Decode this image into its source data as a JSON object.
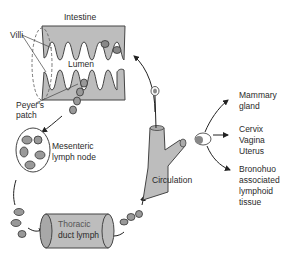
{
  "diagram": {
    "labels": {
      "intestine": "Intestine",
      "villi": "Villi",
      "lumen": "Lumen",
      "peyers_patch_1": "Peyer's",
      "peyers_patch_2": "patch",
      "mesenteric_1": "Mesenteric",
      "mesenteric_2": "lymph node",
      "thoracic_1": "Thoracic",
      "thoracic_2": "duct lymph",
      "circulation": "Circulation",
      "mammary_1": "Mammary",
      "mammary_2": "gland",
      "cervix": "Cervix",
      "vagina": "Vagina",
      "uterus": "Uterus",
      "bronchus_1": "Bronohuo",
      "bronchus_2": "associated",
      "bronchus_3": "lymphoid",
      "bronchus_4": "tissue"
    },
    "colors": {
      "tissue_fill": "#bdbdbd",
      "cell_fill": "#9a9a9a",
      "outline": "#3a3a3a",
      "text": "#2a2a2a"
    }
  }
}
